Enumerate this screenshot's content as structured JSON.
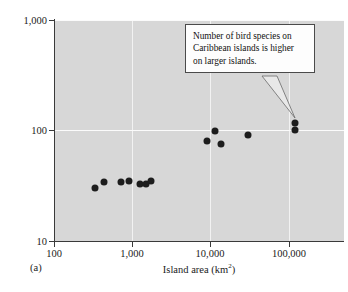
{
  "figure": {
    "panel_label": "(a)",
    "background_color": "#d7d7d7",
    "marker_color": "#1d1d1d",
    "gridline_color": "#f2f2f2"
  },
  "annotation": {
    "text": "Number of bird species on Caribbean islands is higher on larger islands.",
    "line1": "Number of bird species on",
    "line2": "Caribbean islands is higher",
    "line3": "on larger islands.",
    "points_to": {
      "x": 118000,
      "y": 118
    }
  },
  "axes": {
    "x": {
      "label_prefix": "Island area (km",
      "label_sup": "2",
      "label_suffix": ")",
      "label_full": "Island area (km2)",
      "ticks": [
        "100",
        "1,000",
        "10,000",
        "100,000"
      ],
      "tick_values": [
        100,
        1000,
        10000,
        100000
      ],
      "scale": "log"
    },
    "y": {
      "label": "Number of bird species",
      "ticks": [
        "10",
        "100",
        "1,000"
      ],
      "tick_values": [
        10,
        100,
        1000
      ],
      "scale": "log"
    }
  },
  "chart_data": {
    "type": "scatter",
    "title": "",
    "xlabel": "Island area (km2)",
    "ylabel": "Number of bird species",
    "xscale": "log",
    "yscale": "log",
    "xlim": [
      100,
      300000
    ],
    "ylim": [
      10,
      1000
    ],
    "xticks": [
      100,
      1000,
      10000,
      100000
    ],
    "xticklabels": [
      "100",
      "1,000",
      "10,000",
      "100,000"
    ],
    "yticks": [
      10,
      100,
      1000
    ],
    "yticklabels": [
      "10",
      "100",
      "1,000"
    ],
    "grid": true,
    "legend": null,
    "series": [
      {
        "name": "Caribbean islands",
        "marker": "filled-circle",
        "color": "#1d1d1d",
        "points": [
          {
            "x": 330,
            "y": 30
          },
          {
            "x": 440,
            "y": 34
          },
          {
            "x": 720,
            "y": 34
          },
          {
            "x": 900,
            "y": 35
          },
          {
            "x": 1250,
            "y": 33
          },
          {
            "x": 1500,
            "y": 33
          },
          {
            "x": 1750,
            "y": 35
          },
          {
            "x": 9000,
            "y": 81
          },
          {
            "x": 11500,
            "y": 99
          },
          {
            "x": 13500,
            "y": 75
          },
          {
            "x": 30000,
            "y": 92
          },
          {
            "x": 118000,
            "y": 118
          },
          {
            "x": 118000,
            "y": 101
          }
        ]
      }
    ],
    "annotations": [
      {
        "text": "Number of bird species on Caribbean islands is higher on larger islands.",
        "target": {
          "x": 118000,
          "y": 118
        }
      }
    ]
  }
}
